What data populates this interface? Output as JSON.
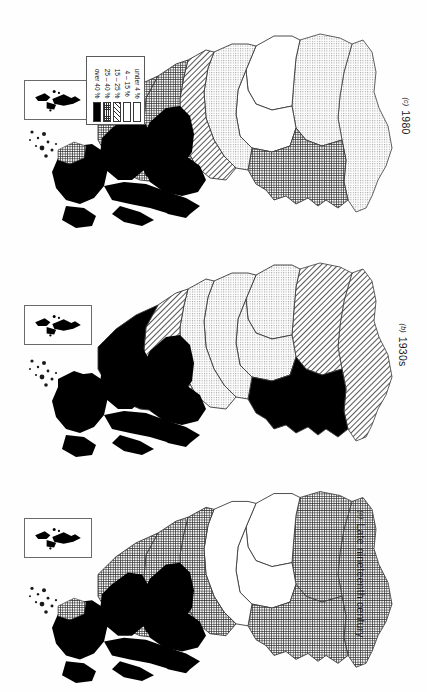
{
  "figure": {
    "kind": "three-panel choropleth map series",
    "region": "Scotland",
    "orientation_note": "maps and all text are rotated 90 degrees clockwise on the page"
  },
  "legend": {
    "title": "",
    "items": [
      {
        "label": "under 4 %",
        "pattern": "blank",
        "color": "#ffffff"
      },
      {
        "label": "4 – 15 %",
        "pattern": "dots",
        "color": "#e8e8e8"
      },
      {
        "label": "15 – 25 %",
        "pattern": "hatch",
        "color": "#d2d2d2"
      },
      {
        "label": "25 – 40 %",
        "pattern": "grid",
        "color": "#9a9a9a"
      },
      {
        "label": "over 40 %",
        "pattern": "solid",
        "color": "#000000"
      }
    ]
  },
  "panels": [
    {
      "id": "(c)",
      "caption": "1980",
      "inset_label": "",
      "regions": [
        {
          "name": "outer-hebrides",
          "pattern": "solid"
        },
        {
          "name": "skye-lochalsh",
          "pattern": "solid"
        },
        {
          "name": "wester-ross",
          "pattern": "solid"
        },
        {
          "name": "lochaber",
          "pattern": "solid"
        },
        {
          "name": "argyll-islands",
          "pattern": "solid"
        },
        {
          "name": "sutherland",
          "pattern": "grid"
        },
        {
          "name": "caithness",
          "pattern": "grid"
        },
        {
          "name": "easter-ross",
          "pattern": "hatch"
        },
        {
          "name": "inverness",
          "pattern": "dots"
        },
        {
          "name": "nairn-moray",
          "pattern": "blank"
        },
        {
          "name": "badenoch",
          "pattern": "blank"
        },
        {
          "name": "perthshire",
          "pattern": "grid"
        },
        {
          "name": "aberdeenshire",
          "pattern": "dots"
        },
        {
          "name": "angus-fife",
          "pattern": "dots"
        },
        {
          "name": "shetland-inset",
          "pattern": "solid"
        }
      ]
    },
    {
      "id": "(b)",
      "caption": "1930s",
      "inset_label": "",
      "regions": [
        {
          "name": "outer-hebrides",
          "pattern": "solid"
        },
        {
          "name": "skye-lochalsh",
          "pattern": "solid"
        },
        {
          "name": "wester-ross",
          "pattern": "solid"
        },
        {
          "name": "lochaber",
          "pattern": "solid"
        },
        {
          "name": "argyll-islands",
          "pattern": "solid"
        },
        {
          "name": "sutherland",
          "pattern": "solid"
        },
        {
          "name": "caithness",
          "pattern": "hatch"
        },
        {
          "name": "easter-ross",
          "pattern": "dots"
        },
        {
          "name": "inverness",
          "pattern": "dots"
        },
        {
          "name": "nairn-moray",
          "pattern": "dots"
        },
        {
          "name": "badenoch",
          "pattern": "dots"
        },
        {
          "name": "perthshire",
          "pattern": "solid"
        },
        {
          "name": "aberdeenshire",
          "pattern": "hatch"
        },
        {
          "name": "angus-fife",
          "pattern": "hatch"
        },
        {
          "name": "shetland-inset",
          "pattern": "solid"
        }
      ]
    },
    {
      "id": "(a)",
      "caption": "Late nineteenth century",
      "inset_label": "",
      "regions": [
        {
          "name": "outer-hebrides",
          "pattern": "solid"
        },
        {
          "name": "skye-lochalsh",
          "pattern": "solid"
        },
        {
          "name": "wester-ross",
          "pattern": "solid"
        },
        {
          "name": "lochaber",
          "pattern": "solid"
        },
        {
          "name": "argyll-islands",
          "pattern": "solid"
        },
        {
          "name": "sutherland",
          "pattern": "grid"
        },
        {
          "name": "caithness",
          "pattern": "grid"
        },
        {
          "name": "easter-ross",
          "pattern": "grid"
        },
        {
          "name": "inverness",
          "pattern": "blank"
        },
        {
          "name": "nairn-moray",
          "pattern": "blank"
        },
        {
          "name": "badenoch",
          "pattern": "blank"
        },
        {
          "name": "perthshire",
          "pattern": "grid"
        },
        {
          "name": "aberdeenshire",
          "pattern": "grid"
        },
        {
          "name": "angus-fife",
          "pattern": "grid"
        },
        {
          "name": "shetland-inset",
          "pattern": "solid"
        }
      ]
    }
  ]
}
